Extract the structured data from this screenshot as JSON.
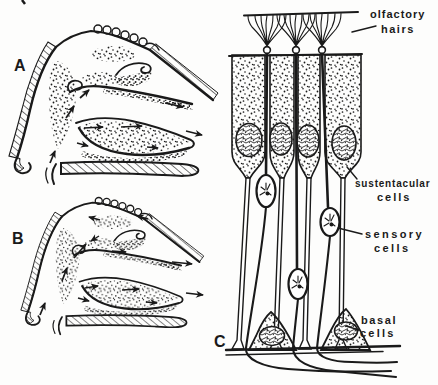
{
  "colors": {
    "ink": "#1a1a1a",
    "paper": "#fdfdfc"
  },
  "panels": {
    "a": {
      "letter": "A"
    },
    "b": {
      "letter": "B"
    },
    "c": {
      "letter": "C"
    }
  },
  "labels": {
    "olfactory_hairs": {
      "line1": "olfactory",
      "line2": "hairs"
    },
    "sustentacular_cells": {
      "line1": "sustentacular",
      "line2": "cells"
    },
    "sensory_cells": {
      "line1": "sensory",
      "line2": "cells"
    },
    "basal_cells": {
      "line1": "basal",
      "line2": "cells"
    }
  }
}
